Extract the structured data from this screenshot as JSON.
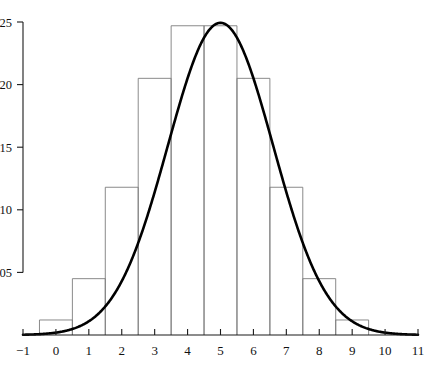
{
  "chart_data": {
    "type": "bar",
    "title": "",
    "subtitle": "",
    "xlabel": "",
    "ylabel": "",
    "xlim": [
      -1,
      11
    ],
    "ylim": [
      0,
      0.262
    ],
    "grid": false,
    "legend": "none",
    "x_ticks": [
      "−1",
      "0",
      "1",
      "2",
      "3",
      "4",
      "5",
      "6",
      "7",
      "8",
      "9",
      "10",
      "11"
    ],
    "x_tick_values": [
      -1,
      0,
      1,
      2,
      3,
      4,
      5,
      6,
      7,
      8,
      9,
      10,
      11
    ],
    "y_ticks": [
      "0.05",
      "0.10",
      "0.15",
      "0.20",
      "0.25"
    ],
    "y_tick_values": [
      0.05,
      0.1,
      0.15,
      0.2,
      0.25
    ],
    "bin_width": 1,
    "bin_edges": [
      -0.5,
      0.5,
      1.5,
      2.5,
      3.5,
      4.5,
      5.5,
      6.5,
      7.5,
      8.5,
      9.5
    ],
    "categories": [
      "-0.5 to 0.5",
      "0.5 to 1.5",
      "1.5 to 2.5",
      "2.5 to 3.5",
      "3.5 to 4.5",
      "4.5 to 5.5",
      "5.5 to 6.5",
      "6.5 to 7.5",
      "7.5 to 8.5",
      "8.5 to 9.5"
    ],
    "values": [
      0.012,
      0.045,
      0.118,
      0.205,
      0.247,
      0.247,
      0.205,
      0.118,
      0.045,
      0.012
    ],
    "series": [
      {
        "name": "histogram",
        "type": "bar",
        "values": [
          0.012,
          0.045,
          0.118,
          0.205,
          0.247,
          0.247,
          0.205,
          0.118,
          0.045,
          0.012
        ]
      },
      {
        "name": "normal-density-curve",
        "type": "line",
        "distribution": "normal",
        "mean": 5,
        "sd": 1.6,
        "peak_x": 5,
        "peak_y": 0.2494
      }
    ],
    "colors": {
      "curve": "#000000",
      "bar_outline": "#7d7d7d",
      "axis": "#1a1a1a",
      "background": "#ffffff"
    }
  }
}
